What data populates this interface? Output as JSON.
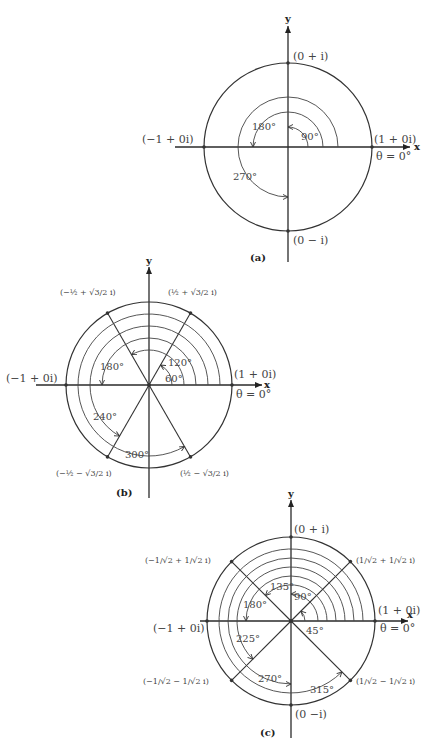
{
  "figures": [
    {
      "caption": "(a)",
      "axis_x": "x",
      "axis_y": "y",
      "points": {
        "top": "(0 + i)",
        "bottom": "(0 − i)",
        "left": "(−1 + 0i)",
        "right": "(1 + 0i)"
      },
      "theta_label": "θ = 0°",
      "angles": [
        "90°",
        "180°",
        "270°"
      ]
    },
    {
      "caption": "(b)",
      "axis_x": "x",
      "axis_y": "y",
      "points": {
        "left": "(−1 + 0i)",
        "right": "(1 + 0i)",
        "upper_left": "(−½ + √3/2 i)",
        "upper_right": "(½ + √3/2 i)",
        "lower_left": "(−½ − √3/2 i)",
        "lower_right": "(½ − √3/2 i)"
      },
      "theta_label": "θ = 0°",
      "angles": [
        "60°",
        "120°",
        "180°",
        "240°",
        "300°"
      ]
    },
    {
      "caption": "(c)",
      "axis_x": "x",
      "axis_y": "y",
      "points": {
        "top": "(0 + i)",
        "bottom": "(0 −i)",
        "left": "(−1 + 0i)",
        "right": "(1 + 0i)",
        "upper_left": "(−1/√2 + 1/√2 i)",
        "upper_right": "(1/√2 + 1/√2 i)",
        "lower_left": "(−1/√2 − 1/√2 i)",
        "lower_right": "(1/√2 − 1/√2 i)"
      },
      "theta_label": "θ = 0°",
      "angles": [
        "45°",
        "90°",
        "135°",
        "180°",
        "225°",
        "270°",
        "315°"
      ]
    }
  ]
}
